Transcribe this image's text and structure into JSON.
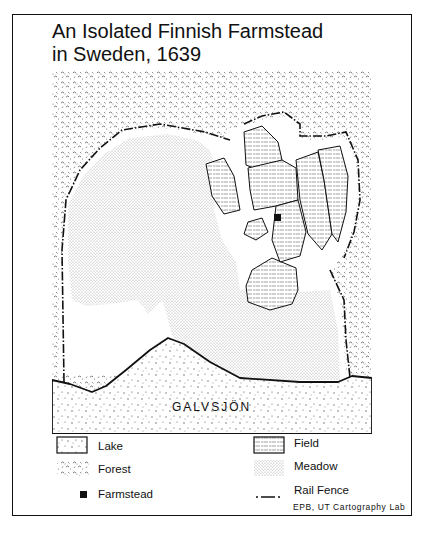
{
  "title": {
    "line1": "An Isolated Finnish Farmstead",
    "line2": "in Sweden, 1639"
  },
  "map": {
    "lake_name": "GALVSJÖN",
    "colors": {
      "ink": "#111111",
      "paper": "#ffffff",
      "forest_glyph": "#444444",
      "meadow_dot": "#9a9a9a",
      "field_dash": "#888888",
      "lake_dot": "#555555"
    }
  },
  "legend": {
    "items": [
      {
        "key": "lake",
        "label": "Lake",
        "icon": "lake-swatch"
      },
      {
        "key": "forest",
        "label": "Forest",
        "icon": "forest-swatch"
      },
      {
        "key": "farmstead",
        "label": "Farmstead",
        "icon": "farmstead-square"
      },
      {
        "key": "field",
        "label": "Field",
        "icon": "field-swatch"
      },
      {
        "key": "meadow",
        "label": "Meadow",
        "icon": "meadow-swatch"
      },
      {
        "key": "rail_fence",
        "label": "Rail Fence",
        "icon": "dash-dot-line"
      }
    ]
  },
  "credit": "EPB, UT Cartography Lab"
}
